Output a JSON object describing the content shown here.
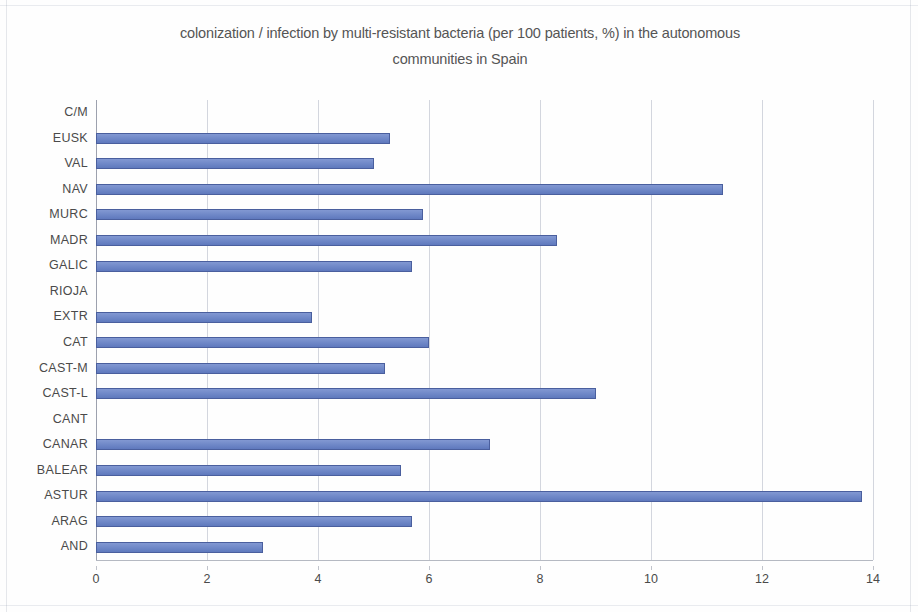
{
  "chart_data": {
    "type": "bar",
    "orientation": "horizontal",
    "title": "colonization / infection by multi-resistant bacteria (per 100 patients, %) in the autonomous communities in Spain",
    "title_line1": "colonization / infection by multi-resistant bacteria (per 100 patients, %) in the autonomous",
    "title_line2": "communities in Spain",
    "xlabel": "",
    "ylabel": "",
    "xlim": [
      0,
      14
    ],
    "xticks": [
      0,
      2,
      4,
      6,
      8,
      10,
      12,
      14
    ],
    "xtick_labels": [
      "0",
      "2",
      "4",
      "6",
      "8",
      "10",
      "12",
      "14"
    ],
    "grid": true,
    "grid_axis": "x",
    "legend": false,
    "bar_color": "#7089c8",
    "bar_border_color": "#4a5f9e",
    "categories": [
      "C/M",
      "EUSK",
      "VAL",
      "NAV",
      "MURC",
      "MADR",
      "GALIC",
      "RIOJA",
      "EXTR",
      "CAT",
      "CAST-M",
      "CAST-L",
      "CANT",
      "CANAR",
      "BALEAR",
      "ASTUR",
      "ARAG",
      "AND"
    ],
    "values": [
      0,
      5.3,
      5.0,
      11.3,
      5.9,
      8.3,
      5.7,
      0,
      3.9,
      6.0,
      5.2,
      9.0,
      0,
      7.1,
      5.5,
      13.8,
      5.7,
      3.0
    ],
    "series": [
      {
        "name": "colonization / infection (%)",
        "values": [
          0,
          5.3,
          5.0,
          11.3,
          5.9,
          8.3,
          5.7,
          0,
          3.9,
          6.0,
          5.2,
          9.0,
          0,
          7.1,
          5.5,
          13.8,
          5.7,
          3.0
        ]
      }
    ]
  }
}
